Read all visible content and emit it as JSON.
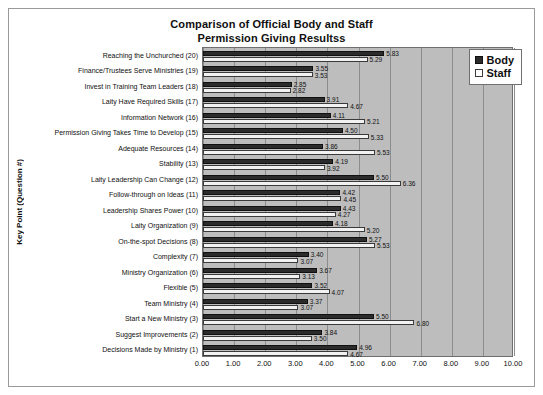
{
  "chart_data": {
    "type": "bar",
    "orientation": "horizontal",
    "title": "Comparison of Official Body and Staff",
    "title_line2": "Permission Giving Resultss",
    "xlabel": "",
    "ylabel": "Key Point (Question #)",
    "xlim": [
      0,
      10
    ],
    "xticks": [
      "0.00",
      "1.00",
      "2.00",
      "3.00",
      "4.00",
      "5.00",
      "6.00",
      "7.00",
      "8.00",
      "9.00",
      "10.00"
    ],
    "grid": true,
    "legend_position": "top-right",
    "plot_background": "#bdbdbd",
    "colors": {
      "body": "#2b2b2b",
      "staff": "#f2f2f2"
    },
    "categories": [
      "Reaching the Unchurched (20)",
      "Finance/Trustees Serve Ministries (19)",
      "Invest in Training Team Leaders (18)",
      "Laity Have Required Skills (17)",
      "Information Network (16)",
      "Permission Giving Takes Time to Develop (15)",
      "Adequate Resources (14)",
      "Stability (13)",
      "Laity Leadership Can Change (12)",
      "Follow-through on Ideas (11)",
      "Leadership Shares Power (10)",
      "Laity Organization (9)",
      "On-the-spot Decisions (8)",
      "Complexity (7)",
      "Ministry Organization (6)",
      "Flexible (5)",
      "Team Ministry (4)",
      "Start a New Ministry (3)",
      "Suggest Improvements (2)",
      "Decisions Made by Ministry (1)"
    ],
    "series": [
      {
        "name": "Body",
        "values": [
          5.83,
          3.55,
          2.85,
          3.91,
          4.11,
          4.5,
          3.86,
          4.19,
          5.5,
          4.42,
          4.43,
          4.18,
          5.27,
          3.4,
          3.67,
          3.52,
          3.37,
          5.5,
          3.84,
          4.96
        ],
        "labels": [
          "5.83",
          "3.55",
          "2.85",
          "3.91",
          "4.11",
          "4.50",
          "3.86",
          "4.19",
          "5.50",
          "4.42",
          "4.43",
          "4.18",
          "5.27",
          "3.40",
          "3.67",
          "3.52",
          "3.37",
          "5.50",
          "3.84",
          "4.96"
        ]
      },
      {
        "name": "Staff",
        "values": [
          5.29,
          3.53,
          2.82,
          4.67,
          5.21,
          5.33,
          5.53,
          3.92,
          6.36,
          4.45,
          4.27,
          5.2,
          5.53,
          3.07,
          3.13,
          4.07,
          3.07,
          6.8,
          3.5,
          4.67
        ],
        "labels": [
          "5.29",
          "3.53",
          "2.82",
          "4.67",
          "5.21",
          "5.33",
          "5.53",
          "3.92",
          "6.36",
          "4.45",
          "4.27",
          "5.20",
          "5.53",
          "3.07",
          "3.13",
          "4.07",
          "3.07",
          "6.80",
          "3.50",
          "4.67"
        ]
      }
    ]
  },
  "legend": {
    "items": [
      {
        "label": "Body",
        "swatch": "body"
      },
      {
        "label": "Staff",
        "swatch": "staff"
      }
    ]
  }
}
